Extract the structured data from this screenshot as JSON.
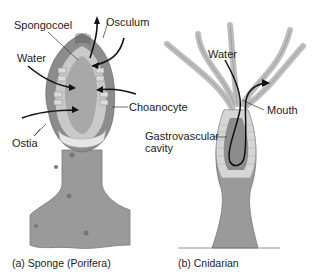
{
  "panels": [
    {
      "id": "a",
      "caption_letter": "(a)",
      "caption_text": "Sponge (Porifera)",
      "labels": {
        "spongocoel": "Spongocoel",
        "osculum": "Osculum",
        "water": "Water",
        "choanocyte": "Choanocyte",
        "ostia": "Ostia"
      }
    },
    {
      "id": "b",
      "caption_letter": "(b)",
      "caption_text": "Cnidarian",
      "labels": {
        "water": "Water",
        "mouth": "Mouth",
        "gastrovascular_line1": "Gastrovascular",
        "gastrovascular_line2": "cavity"
      }
    }
  ],
  "colors": {
    "body_gray": "#8f8f8f",
    "inner_gray": "#b5b5b5",
    "light_gray": "#d0d0d0",
    "arrow": "#111111",
    "text": "#222222"
  }
}
